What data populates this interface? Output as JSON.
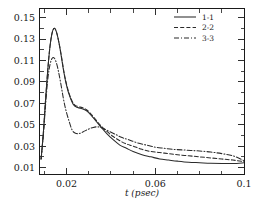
{
  "chart_data": {
    "type": "line",
    "title": "",
    "xlabel": "t (psec)",
    "ylabel": "",
    "xlim": [
      0.008,
      0.1
    ],
    "ylim": [
      0.004,
      0.158
    ],
    "grid": false,
    "legend_position": "top-right",
    "x_ticks": [
      0.02,
      0.06,
      0.1
    ],
    "x_tick_labels": [
      "0.02",
      "0.06",
      "0.1"
    ],
    "x_minor_ticks": [
      0.01,
      0.03,
      0.04,
      0.05,
      0.07,
      0.08,
      0.09
    ],
    "y_ticks": [
      0.01,
      0.03,
      0.05,
      0.07,
      0.09,
      0.11,
      0.13,
      0.15
    ],
    "y_tick_labels": [
      "0.01",
      "0.03",
      "0.05",
      "0.07",
      "0.09",
      "0.11",
      "0.13",
      "0.15"
    ],
    "y_minor_ticks": [
      0.02,
      0.04,
      0.06,
      0.08,
      0.1,
      0.12,
      0.14
    ],
    "series": [
      {
        "name": "1-1",
        "style": "solid",
        "dasharray": "",
        "x": [
          0.0085,
          0.0095,
          0.0105,
          0.0115,
          0.0125,
          0.0135,
          0.0145,
          0.0155,
          0.0165,
          0.0175,
          0.0185,
          0.0195,
          0.021,
          0.023,
          0.025,
          0.027,
          0.029,
          0.031,
          0.033,
          0.035,
          0.038,
          0.041,
          0.044,
          0.047,
          0.05,
          0.054,
          0.058,
          0.062,
          0.066,
          0.07,
          0.075,
          0.08,
          0.085,
          0.09,
          0.095,
          0.1
        ],
        "y": [
          0.018,
          0.042,
          0.073,
          0.101,
          0.123,
          0.136,
          0.14,
          0.136,
          0.127,
          0.115,
          0.102,
          0.091,
          0.079,
          0.069,
          0.066,
          0.065,
          0.063,
          0.059,
          0.054,
          0.049,
          0.042,
          0.036,
          0.031,
          0.028,
          0.025,
          0.022,
          0.02,
          0.018,
          0.017,
          0.016,
          0.015,
          0.0145,
          0.014,
          0.0138,
          0.0138,
          0.0145
        ]
      },
      {
        "name": "2-2",
        "style": "dashed",
        "dasharray": "4,2.2",
        "x": [
          0.0085,
          0.0095,
          0.0105,
          0.0115,
          0.0125,
          0.0135,
          0.0145,
          0.0155,
          0.0165,
          0.0175,
          0.0185,
          0.0195,
          0.021,
          0.023,
          0.025,
          0.027,
          0.029,
          0.031,
          0.033,
          0.035,
          0.038,
          0.041,
          0.044,
          0.047,
          0.05,
          0.054,
          0.058,
          0.062,
          0.066,
          0.07,
          0.075,
          0.08,
          0.085,
          0.09,
          0.095,
          0.1
        ],
        "y": [
          0.018,
          0.042,
          0.073,
          0.101,
          0.123,
          0.136,
          0.14,
          0.136,
          0.127,
          0.116,
          0.103,
          0.092,
          0.08,
          0.07,
          0.067,
          0.066,
          0.064,
          0.06,
          0.055,
          0.05,
          0.044,
          0.039,
          0.035,
          0.032,
          0.03,
          0.027,
          0.025,
          0.024,
          0.023,
          0.022,
          0.021,
          0.02,
          0.019,
          0.018,
          0.017,
          0.0155
        ]
      },
      {
        "name": "3-3",
        "style": "dash-dot",
        "dasharray": "5,2,1,2",
        "x": [
          0.0085,
          0.0095,
          0.0105,
          0.0115,
          0.0125,
          0.0135,
          0.0145,
          0.0155,
          0.0165,
          0.0175,
          0.0185,
          0.0195,
          0.021,
          0.0225,
          0.024,
          0.026,
          0.028,
          0.03,
          0.032,
          0.034,
          0.036,
          0.039,
          0.042,
          0.045,
          0.048,
          0.052,
          0.056,
          0.06,
          0.064,
          0.068,
          0.072,
          0.076,
          0.08,
          0.085,
          0.09,
          0.095,
          0.1
        ],
        "y": [
          0.018,
          0.04,
          0.068,
          0.092,
          0.106,
          0.112,
          0.112,
          0.107,
          0.098,
          0.087,
          0.075,
          0.065,
          0.054,
          0.045,
          0.042,
          0.042,
          0.044,
          0.046,
          0.0475,
          0.048,
          0.047,
          0.044,
          0.041,
          0.038,
          0.036,
          0.033,
          0.031,
          0.029,
          0.028,
          0.027,
          0.0265,
          0.026,
          0.0255,
          0.0245,
          0.023,
          0.021,
          0.0165
        ]
      }
    ]
  },
  "legend": {
    "entries": [
      {
        "label": "1-1"
      },
      {
        "label": "2-2"
      },
      {
        "label": "3-3"
      }
    ]
  }
}
